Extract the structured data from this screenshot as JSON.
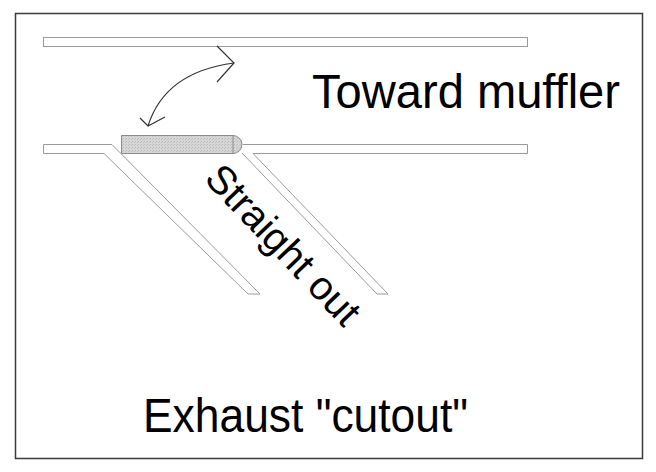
{
  "diagram": {
    "labels": {
      "top_right": "Toward muffler",
      "diagonal": "Straight out",
      "bottom": "Exhaust \"cutout\""
    },
    "colors": {
      "frame": "#3a3a3a",
      "pipe_stroke": "#9a9a9a",
      "pipe_fill": "#ffffff",
      "damper_fill": "#cfcfcf",
      "damper_stroke": "#8a8a8a",
      "arrow": "#333333",
      "text": "#000000"
    },
    "elements": [
      {
        "id": "upper-pipe",
        "type": "pipe",
        "description": "straight pipe toward muffler"
      },
      {
        "id": "lower-pipe-left",
        "type": "pipe",
        "description": "inlet pipe"
      },
      {
        "id": "lower-pipe-right",
        "type": "pipe",
        "description": "outlet pipe continuing"
      },
      {
        "id": "diagonal-branch",
        "type": "pipe",
        "description": "angled cutout branch"
      },
      {
        "id": "damper-valve",
        "type": "flap",
        "description": "shaded pivoting flap"
      },
      {
        "id": "swing-arrow",
        "type": "double-arrow",
        "description": "curved arrow showing flap swing"
      }
    ]
  }
}
